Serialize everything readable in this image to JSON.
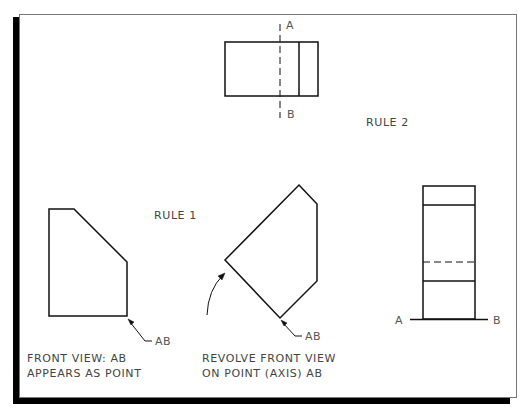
{
  "diagram": {
    "rule_labels": {
      "rule1": "RULE 1",
      "rule2": "RULE 2"
    },
    "top_view": {
      "axis_label_top": "A",
      "axis_label_bottom": "B"
    },
    "front_view": {
      "point_label": "AB",
      "caption_line1": "FRONT VIEW: AB",
      "caption_line2": "APPEARS AS POINT"
    },
    "revolved_view": {
      "point_label": "AB",
      "caption_line1": "REVOLVE FRONT VIEW",
      "caption_line2": "ON POINT (AXIS) AB"
    },
    "side_view": {
      "axis_label_left": "A",
      "axis_label_right": "B"
    },
    "colors": {
      "line": "#111111",
      "text": "#444444",
      "frame_shadow": "#000000",
      "frame_border": "#777777"
    }
  }
}
